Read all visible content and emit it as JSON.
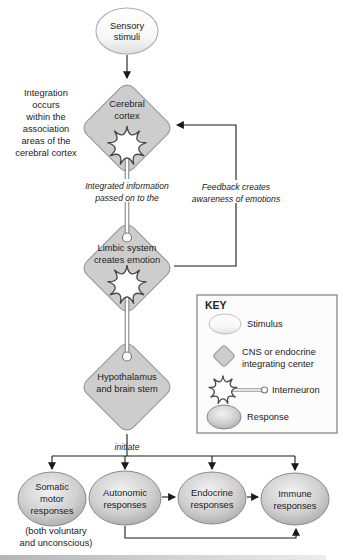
{
  "figure": {
    "type": "flow-diagram",
    "background": "#ffffff"
  },
  "nodes": {
    "sensory_stimuli": {
      "lines": [
        "Sensory",
        "stimuli"
      ]
    },
    "cerebral_cortex": {
      "lines": [
        "Cerebral",
        "cortex"
      ]
    },
    "limbic_system": {
      "lines": [
        "Limbic system",
        "creates emotion"
      ]
    },
    "hypothalamus": {
      "lines": [
        "Hypothalamus",
        "and brain stem"
      ]
    },
    "somatic": {
      "lines": [
        "Somatic",
        "motor",
        "responses"
      ]
    },
    "autonomic": {
      "lines": [
        "Autonomic",
        "responses"
      ]
    },
    "endocrine": {
      "lines": [
        "Endocrine",
        "responses"
      ]
    },
    "immune": {
      "lines": [
        "Immune",
        "responses"
      ]
    }
  },
  "annotations": {
    "integration_note": {
      "lines": [
        "Integration",
        "occurs",
        "within the",
        "association",
        "areas of the",
        "cerebral cortex"
      ]
    },
    "integrated_info": {
      "lines": [
        "Integrated information",
        "passed on to the"
      ]
    },
    "feedback": {
      "lines": [
        "Feedback creates",
        "awareness of emotions"
      ]
    },
    "initiate": "initiate",
    "somatic_note": {
      "lines": [
        "(both voluntary",
        "and unconscious)"
      ]
    }
  },
  "key": {
    "title": "KEY",
    "items": [
      {
        "icon": "stimulus-ellipse-icon",
        "lines": [
          "Stimulus"
        ]
      },
      {
        "icon": "integrating-center-diamond-icon",
        "lines": [
          "CNS or endocrine",
          "integrating center"
        ]
      },
      {
        "icon": "interneuron-icon",
        "lines": [
          "Interneuron"
        ]
      },
      {
        "icon": "response-ellipse-icon",
        "lines": [
          "Response"
        ]
      }
    ]
  },
  "colors": {
    "diamond_fill": "#cdcdcd",
    "diamond_border": "#9b9b9b",
    "stimulus_fill_top": "#ffffff",
    "stimulus_fill_bottom": "#dedede",
    "response_fill_center": "#f2f2f2",
    "response_fill_edge": "#9e9e9e",
    "interneuron_fill": "#ffffff",
    "interneuron_outline": "#4a4a4a",
    "arrow_color": "#1a1a1a",
    "text_color": "#222222"
  }
}
